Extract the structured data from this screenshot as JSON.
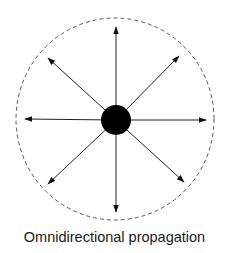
{
  "figure": {
    "caption": "Omnidirectional propagation",
    "colors": {
      "stroke": "#222222",
      "source_fill": "#000000",
      "boundary": "#444444",
      "background": "#ffffff"
    },
    "source": {
      "label": "point-source",
      "cx": 116,
      "cy": 120,
      "r": 15
    },
    "boundary": {
      "label": "wavefront-boundary",
      "style": "dashed",
      "cx": 115,
      "cy": 119,
      "rx": 99,
      "ry": 101
    },
    "arrows": [
      {
        "direction": "north",
        "x2": 116,
        "y2": 27
      },
      {
        "direction": "north-east",
        "x2": 179,
        "y2": 56
      },
      {
        "direction": "east",
        "x2": 206,
        "y2": 120
      },
      {
        "direction": "south-east",
        "x2": 184,
        "y2": 182
      },
      {
        "direction": "south",
        "x2": 116,
        "y2": 212
      },
      {
        "direction": "south-west",
        "x2": 48,
        "y2": 184
      },
      {
        "direction": "west",
        "x2": 25,
        "y2": 119
      },
      {
        "direction": "north-west",
        "x2": 48,
        "y2": 58
      }
    ]
  }
}
